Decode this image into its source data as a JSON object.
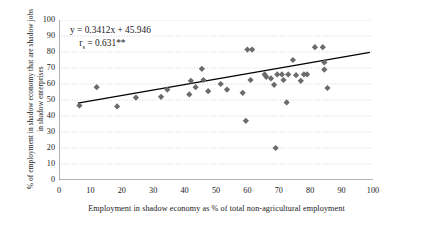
{
  "chart_data": {
    "type": "scatter",
    "title": "",
    "xlabel": "Employment in shadow economy as % of total non-agricultural employment",
    "ylabel": "% of employment in shadow economy that are shadow jobs in shadow enterprises",
    "xlim": [
      0,
      100
    ],
    "ylim": [
      0,
      100
    ],
    "xticks": [
      0,
      10,
      20,
      30,
      40,
      50,
      60,
      70,
      80,
      90,
      100
    ],
    "yticks": [
      0,
      10,
      20,
      30,
      40,
      50,
      60,
      70,
      80,
      90,
      100
    ],
    "grid": true,
    "grid_style": "dotted-horizontal",
    "legend": "none",
    "marker": "diamond",
    "marker_color": "#6b6b6b",
    "trendline": {
      "type": "linear",
      "slope": 0.3412,
      "intercept": 45.946,
      "x_start": 6,
      "x_end": 99,
      "color": "#000000"
    },
    "annotations": {
      "equation": "y = 0.3412x + 45.946",
      "correlation_symbol": "r",
      "correlation_subscript": "s",
      "correlation_text": " = 0.631**"
    },
    "points": [
      {
        "x": 6.5,
        "y": 46.5
      },
      {
        "x": 12.0,
        "y": 58.0
      },
      {
        "x": 18.5,
        "y": 46.0
      },
      {
        "x": 24.5,
        "y": 51.5
      },
      {
        "x": 32.5,
        "y": 52.0
      },
      {
        "x": 34.5,
        "y": 56.5
      },
      {
        "x": 41.5,
        "y": 53.5
      },
      {
        "x": 42.0,
        "y": 62.0
      },
      {
        "x": 43.5,
        "y": 58.0
      },
      {
        "x": 45.5,
        "y": 69.5
      },
      {
        "x": 46.0,
        "y": 62.5
      },
      {
        "x": 47.5,
        "y": 55.5
      },
      {
        "x": 51.5,
        "y": 60.0
      },
      {
        "x": 53.5,
        "y": 56.5
      },
      {
        "x": 58.5,
        "y": 54.5
      },
      {
        "x": 59.5,
        "y": 37.0
      },
      {
        "x": 60.0,
        "y": 81.5
      },
      {
        "x": 61.5,
        "y": 81.5
      },
      {
        "x": 61.0,
        "y": 62.5
      },
      {
        "x": 65.5,
        "y": 66.0
      },
      {
        "x": 66.0,
        "y": 64.5
      },
      {
        "x": 67.5,
        "y": 63.5
      },
      {
        "x": 68.5,
        "y": 59.5
      },
      {
        "x": 69.0,
        "y": 20.0
      },
      {
        "x": 69.5,
        "y": 66.0
      },
      {
        "x": 71.0,
        "y": 66.0
      },
      {
        "x": 71.5,
        "y": 62.5
      },
      {
        "x": 72.5,
        "y": 48.5
      },
      {
        "x": 73.0,
        "y": 66.0
      },
      {
        "x": 74.5,
        "y": 75.0
      },
      {
        "x": 75.5,
        "y": 65.5
      },
      {
        "x": 77.0,
        "y": 62.0
      },
      {
        "x": 78.0,
        "y": 66.0
      },
      {
        "x": 79.0,
        "y": 66.0
      },
      {
        "x": 81.5,
        "y": 83.0
      },
      {
        "x": 84.0,
        "y": 83.0
      },
      {
        "x": 84.5,
        "y": 73.5
      },
      {
        "x": 84.5,
        "y": 69.0
      },
      {
        "x": 85.5,
        "y": 57.5
      }
    ]
  },
  "axes": {
    "y_tick_labels": [
      "100",
      "90",
      "80",
      "70",
      "60",
      "50",
      "40",
      "30",
      "20",
      "10",
      "0"
    ],
    "x_tick_labels": [
      "0",
      "10",
      "20",
      "30",
      "40",
      "50",
      "60",
      "70",
      "80",
      "90",
      "100"
    ]
  }
}
